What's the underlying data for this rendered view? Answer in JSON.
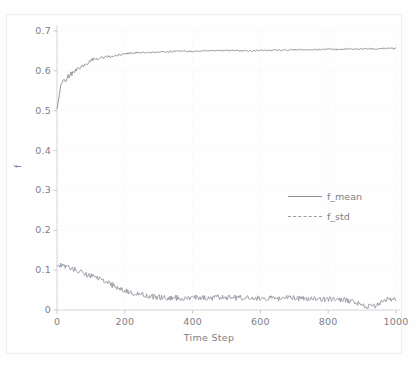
{
  "chart_data": {
    "type": "line",
    "title": "",
    "xlabel": "Time Step",
    "ylabel": "f",
    "xlim": [
      0,
      1000
    ],
    "ylim": [
      0,
      0.7
    ],
    "grid": true,
    "legend_position": "center right",
    "xticks": [
      "0",
      "200",
      "400",
      "600",
      "800",
      "1000"
    ],
    "xtick_values": [
      0,
      200,
      400,
      600,
      800,
      1000
    ],
    "yticks": [
      "0",
      "0.1",
      "0.2",
      "0.3",
      "0.4",
      "0.5",
      "0.6",
      "0.7"
    ],
    "ytick_values": [
      0,
      0.1,
      0.2,
      0.3,
      0.4,
      0.5,
      0.6,
      0.7
    ],
    "series": [
      {
        "name": "f_mean",
        "style": "solid",
        "color": "#8d8d98",
        "x": [
          0,
          10,
          20,
          30,
          40,
          50,
          60,
          70,
          80,
          90,
          100,
          120,
          140,
          160,
          180,
          200,
          240,
          280,
          320,
          360,
          400,
          440,
          480,
          520,
          560,
          600,
          640,
          680,
          720,
          760,
          800,
          840,
          880,
          920,
          960,
          1000
        ],
        "values": [
          0.512,
          0.558,
          0.573,
          0.583,
          0.591,
          0.597,
          0.603,
          0.609,
          0.614,
          0.619,
          0.628,
          0.631,
          0.634,
          0.637,
          0.64,
          0.643,
          0.646,
          0.647,
          0.648,
          0.65,
          0.649,
          0.65,
          0.651,
          0.651,
          0.65,
          0.651,
          0.652,
          0.652,
          0.653,
          0.653,
          0.654,
          0.654,
          0.655,
          0.655,
          0.656,
          0.656
        ],
        "noise_amplitude": 0.004,
        "start_value": 0.512,
        "plateau_value": 0.655
      },
      {
        "name": "f_std",
        "style": "dashed",
        "color": "#9a9aa4",
        "x": [
          0,
          20,
          40,
          60,
          80,
          100,
          120,
          140,
          160,
          180,
          200,
          240,
          280,
          320,
          360,
          400,
          440,
          480,
          520,
          560,
          600,
          640,
          680,
          720,
          760,
          800,
          840,
          880,
          900,
          920,
          940,
          960,
          980,
          1000
        ],
        "values": [
          0.115,
          0.11,
          0.104,
          0.098,
          0.092,
          0.086,
          0.08,
          0.072,
          0.064,
          0.056,
          0.048,
          0.04,
          0.034,
          0.03,
          0.03,
          0.031,
          0.03,
          0.032,
          0.031,
          0.03,
          0.03,
          0.029,
          0.03,
          0.029,
          0.028,
          0.027,
          0.026,
          0.02,
          0.012,
          0.008,
          0.012,
          0.02,
          0.028,
          0.024
        ],
        "noise_amplitude": 0.007,
        "start_value": 0.115,
        "end_value": 0.025
      }
    ],
    "legend_entries": [
      "f_mean",
      "f_std"
    ]
  }
}
